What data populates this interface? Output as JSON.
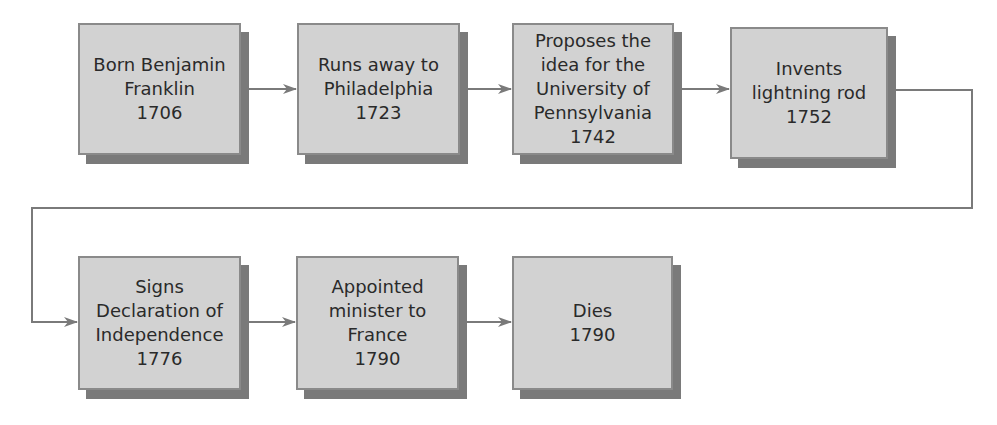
{
  "diagram": {
    "type": "flowchart-timeline",
    "colors": {
      "box_fill": "#d2d2d2",
      "box_border": "#8a8a8a",
      "box_shadow": "#7a7a7a",
      "connector": "#7a7a7a",
      "text": "#2a2a2a"
    },
    "events": [
      {
        "label": "Born Benjamin\nFranklin\n1706",
        "event": "Born Benjamin Franklin",
        "year": "1706"
      },
      {
        "label": "Runs away to\nPhiladelphia\n1723",
        "event": "Runs away to Philadelphia",
        "year": "1723"
      },
      {
        "label": "Proposes the\nidea for the\nUniversity of\nPennsylvania\n1742",
        "event": "Proposes the idea for the University of Pennsylvania",
        "year": "1742"
      },
      {
        "label": "Invents\nlightning rod\n1752",
        "event": "Invents lightning rod",
        "year": "1752"
      },
      {
        "label": "Signs\nDeclaration of\nIndependence\n1776",
        "event": "Signs Declaration of Independence",
        "year": "1776"
      },
      {
        "label": "Appointed\nminister to\nFrance\n1790",
        "event": "Appointed minister to France",
        "year": "1790"
      },
      {
        "label": "Dies\n1790",
        "event": "Dies",
        "year": "1790"
      }
    ],
    "edges": [
      {
        "from": 0,
        "to": 1
      },
      {
        "from": 1,
        "to": 2
      },
      {
        "from": 2,
        "to": 3
      },
      {
        "from": 3,
        "to": 4
      },
      {
        "from": 4,
        "to": 5
      },
      {
        "from": 5,
        "to": 6
      }
    ]
  }
}
